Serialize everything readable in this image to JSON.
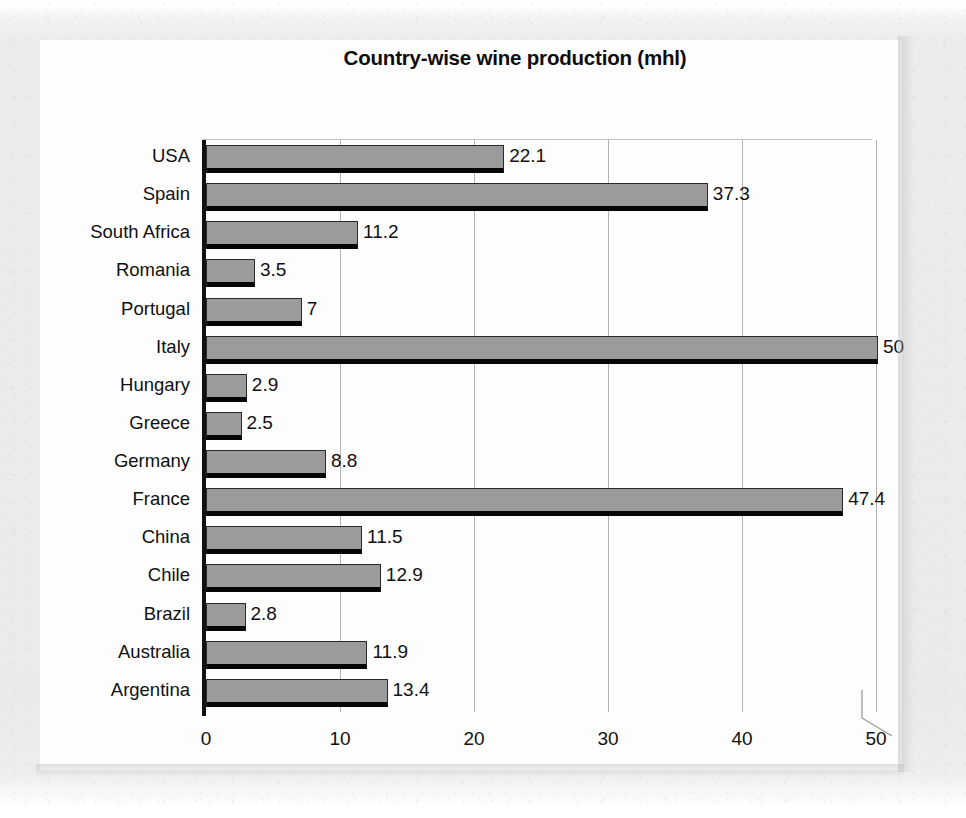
{
  "chart_data": {
    "type": "bar",
    "orientation": "horizontal",
    "title": "Country-wise wine production (mhl)",
    "xlabel": "",
    "ylabel": "",
    "xlim": [
      0,
      50
    ],
    "grid": true,
    "legend": false,
    "xticks": [
      "0",
      "10",
      "20",
      "30",
      "40",
      "50"
    ],
    "categories": [
      "USA",
      "Spain",
      "South Africa",
      "Romania",
      "Portugal",
      "Italy",
      "Hungary",
      "Greece",
      "Germany",
      "France",
      "China",
      "Chile",
      "Brazil",
      "Australia",
      "Argentina"
    ],
    "values": [
      22.1,
      37.3,
      11.2,
      3.5,
      7,
      50,
      2.9,
      2.5,
      8.8,
      47.4,
      11.5,
      12.9,
      2.8,
      11.9,
      13.4
    ],
    "data_labels": [
      "22.1",
      "37.3",
      "11.2",
      "3.5",
      "7",
      "50",
      "2.9",
      "2.5",
      "8.8",
      "47.4",
      "11.5",
      "12.9",
      "2.8",
      "11.9",
      "13.4"
    ],
    "colors": {
      "bar_fill": "#9b9b9b",
      "bar_edge": "#060606",
      "gridline": "#b3b3b3",
      "axis": "#111111",
      "text": "#101010",
      "plot_background": "#fdfdfd",
      "page_background": "#eaeaea"
    }
  }
}
